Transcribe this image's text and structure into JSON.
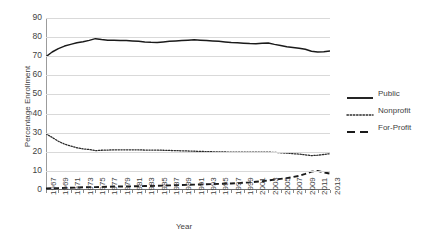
{
  "chart_data": {
    "type": "line",
    "title": "",
    "xlabel": "Year",
    "ylabel": "Percentage Enrollment",
    "xlim": [
      1967,
      2013
    ],
    "ylim": [
      0,
      90
    ],
    "grid": true,
    "legend_position": "right",
    "x": [
      1967,
      1968,
      1969,
      1970,
      1971,
      1972,
      1973,
      1974,
      1975,
      1976,
      1977,
      1978,
      1979,
      1980,
      1981,
      1982,
      1983,
      1984,
      1985,
      1986,
      1987,
      1988,
      1989,
      1990,
      1991,
      1992,
      1993,
      1994,
      1995,
      1996,
      1997,
      1998,
      1999,
      2000,
      2001,
      2002,
      2003,
      2004,
      2005,
      2006,
      2007,
      2008,
      2009,
      2010,
      2011,
      2012,
      2013
    ],
    "xticklabels": [
      "1967",
      "1969",
      "1971",
      "1973",
      "1975",
      "1977",
      "1979",
      "1981",
      "1983",
      "1985",
      "1987",
      "1989",
      "1991",
      "1993",
      "1995",
      "1997",
      "1999",
      "2001",
      "2003",
      "2005",
      "2007",
      "2009",
      "2011",
      "2013"
    ],
    "yticklabels": [
      "0",
      "10",
      "20",
      "30",
      "40",
      "50",
      "60",
      "70",
      "80",
      "90"
    ],
    "series": [
      {
        "name": "Public",
        "style": "solid",
        "color": "#1a1a1a",
        "values": [
          69.8,
          72.2,
          74.0,
          75.3,
          76.2,
          77.0,
          77.6,
          78.3,
          79.2,
          78.7,
          78.4,
          78.3,
          78.2,
          78.2,
          78.0,
          77.8,
          77.5,
          77.3,
          77.2,
          77.5,
          77.8,
          78.0,
          78.2,
          78.4,
          78.6,
          78.4,
          78.2,
          78.0,
          77.8,
          77.5,
          77.2,
          77.0,
          76.8,
          76.6,
          76.5,
          76.8,
          76.9,
          76.2,
          75.6,
          75.0,
          74.6,
          74.2,
          73.6,
          72.6,
          72.2,
          72.4,
          72.8
        ]
      },
      {
        "name": "Nonprofit",
        "style": "dotted",
        "color": "#2b2b2b",
        "values": [
          29.4,
          27.5,
          25.5,
          24.0,
          23.0,
          22.1,
          21.5,
          21.2,
          20.6,
          20.8,
          20.9,
          21.0,
          21.0,
          21.0,
          21.0,
          21.0,
          20.9,
          20.9,
          20.9,
          20.8,
          20.7,
          20.6,
          20.5,
          20.4,
          20.3,
          20.2,
          20.1,
          20.0,
          19.9,
          19.9,
          19.8,
          19.8,
          19.8,
          19.8,
          19.8,
          19.8,
          19.8,
          19.7,
          19.5,
          19.3,
          19.0,
          18.8,
          18.4,
          18.0,
          18.2,
          18.6,
          19.0
        ]
      },
      {
        "name": "For-Profit",
        "style": "dashed",
        "color": "#1a1a1a",
        "values": [
          0.8,
          0.9,
          1.0,
          1.1,
          1.2,
          1.3,
          1.4,
          1.5,
          1.5,
          1.6,
          1.7,
          1.8,
          1.8,
          1.9,
          1.9,
          2.0,
          2.1,
          2.1,
          2.2,
          2.3,
          2.4,
          2.5,
          2.6,
          2.7,
          2.8,
          2.9,
          3.0,
          3.1,
          3.2,
          3.3,
          3.4,
          3.6,
          3.8,
          4.0,
          4.3,
          4.6,
          5.0,
          5.4,
          5.8,
          6.2,
          6.8,
          7.4,
          8.4,
          9.6,
          10.0,
          9.2,
          8.6
        ]
      }
    ]
  }
}
